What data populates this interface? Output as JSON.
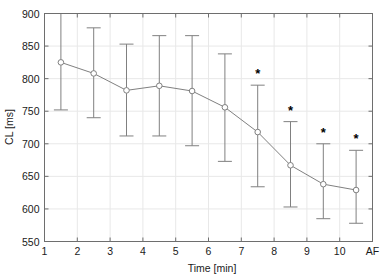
{
  "chart_data": {
    "type": "line",
    "title": "",
    "subtitle": "",
    "xlabel": "Time [min]",
    "ylabel": "CL [ms]",
    "xlim": [
      1,
      11
    ],
    "ylim": [
      550,
      900
    ],
    "grid": true,
    "legend": null,
    "x_tick_labels": [
      "1",
      "2",
      "3",
      "4",
      "5",
      "6",
      "7",
      "8",
      "9",
      "10",
      "AF"
    ],
    "x_tick_values": [
      1,
      2,
      3,
      4,
      5,
      6,
      7,
      8,
      9,
      10,
      11
    ],
    "y_tick_labels": [
      "550",
      "600",
      "650",
      "700",
      "750",
      "800",
      "850",
      "900"
    ],
    "y_tick_values": [
      550,
      600,
      650,
      700,
      750,
      800,
      850,
      900
    ],
    "x": [
      1.5,
      2.5,
      3.5,
      4.5,
      5.5,
      6.5,
      7.5,
      8.5,
      9.5,
      10.5
    ],
    "values": [
      825,
      808,
      782,
      789,
      781,
      756,
      718,
      667,
      638,
      629
    ],
    "error_upper": [
      905,
      878,
      853,
      866,
      866,
      838,
      790,
      734,
      700,
      690
    ],
    "error_lower": [
      752,
      740,
      712,
      712,
      697,
      673,
      634,
      603,
      585,
      578
    ],
    "annotations": [
      {
        "x": 7.5,
        "y": 790,
        "text": "*"
      },
      {
        "x": 8.5,
        "y": 734,
        "text": "*"
      },
      {
        "x": 9.5,
        "y": 700,
        "text": "*"
      },
      {
        "x": 10.5,
        "y": 690,
        "text": "*"
      }
    ],
    "series_color": "#808080",
    "marker": "open-circle",
    "marker_color": "#808080",
    "grid_color": "#e8e8e8",
    "axis_color": "#6e6e6e",
    "background": "#ffffff"
  }
}
